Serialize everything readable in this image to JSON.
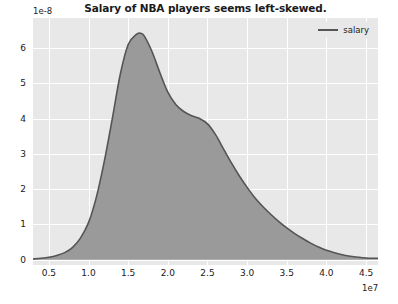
{
  "chart_data": {
    "type": "area",
    "title": "Salary of NBA players seems left-skewed.",
    "xlabel": "",
    "ylabel": "",
    "x_offset_text": "1e7",
    "y_offset_text": "1e-8",
    "xlim": [
      3000000,
      46500000
    ],
    "ylim": [
      -1.5e-09,
      6.85e-08
    ],
    "grid": true,
    "legend_position": "upper right",
    "xticks": [
      5000000,
      10000000,
      15000000,
      20000000,
      25000000,
      30000000,
      35000000,
      40000000,
      45000000
    ],
    "xtick_labels": [
      "0.5",
      "1.0",
      "1.5",
      "2.0",
      "2.5",
      "3.0",
      "3.5",
      "4.0",
      "4.5"
    ],
    "yticks": [
      0,
      1e-08,
      2e-08,
      3e-08,
      4e-08,
      5e-08,
      6e-08
    ],
    "ytick_labels": [
      "0",
      "1",
      "2",
      "3",
      "4",
      "5",
      "6"
    ],
    "series": [
      {
        "name": "salary",
        "line_color": "#555555",
        "fill_color": "#9a9a9a",
        "x": [
          3000000,
          4000000,
          5000000,
          6000000,
          7000000,
          8000000,
          9000000,
          10000000,
          11000000,
          12000000,
          13000000,
          14000000,
          15000000,
          16000000,
          16500000,
          17000000,
          18000000,
          19000000,
          20000000,
          21000000,
          22000000,
          23000000,
          24000000,
          25000000,
          26000000,
          27000000,
          28000000,
          29000000,
          30000000,
          31000000,
          32000000,
          33000000,
          34000000,
          35000000,
          36000000,
          37000000,
          38000000,
          39000000,
          40000000,
          41000000,
          42000000,
          43000000,
          44000000,
          45000000,
          46500000
        ],
        "y": [
          2e-10,
          4e-10,
          7e-10,
          1.2e-09,
          2e-09,
          3.5e-09,
          6.2e-09,
          1.05e-08,
          1.78e-08,
          2.8e-08,
          4e-08,
          5.25e-08,
          6.1e-08,
          6.38e-08,
          6.42e-08,
          6.35e-08,
          5.9e-08,
          5.3e-08,
          4.75e-08,
          4.4e-08,
          4.2e-08,
          4.08e-08,
          4e-08,
          3.85e-08,
          3.55e-08,
          3.15e-08,
          2.75e-08,
          2.38e-08,
          2.05e-08,
          1.75e-08,
          1.5e-08,
          1.28e-08,
          1.08e-08,
          9e-09,
          7.4e-09,
          6e-09,
          4.7e-09,
          3.6e-09,
          2.7e-09,
          2e-09,
          1.4e-09,
          1e-09,
          7e-10,
          5e-10,
          4e-10
        ]
      }
    ]
  },
  "legend": {
    "entries": [
      {
        "label": "salary"
      }
    ]
  }
}
